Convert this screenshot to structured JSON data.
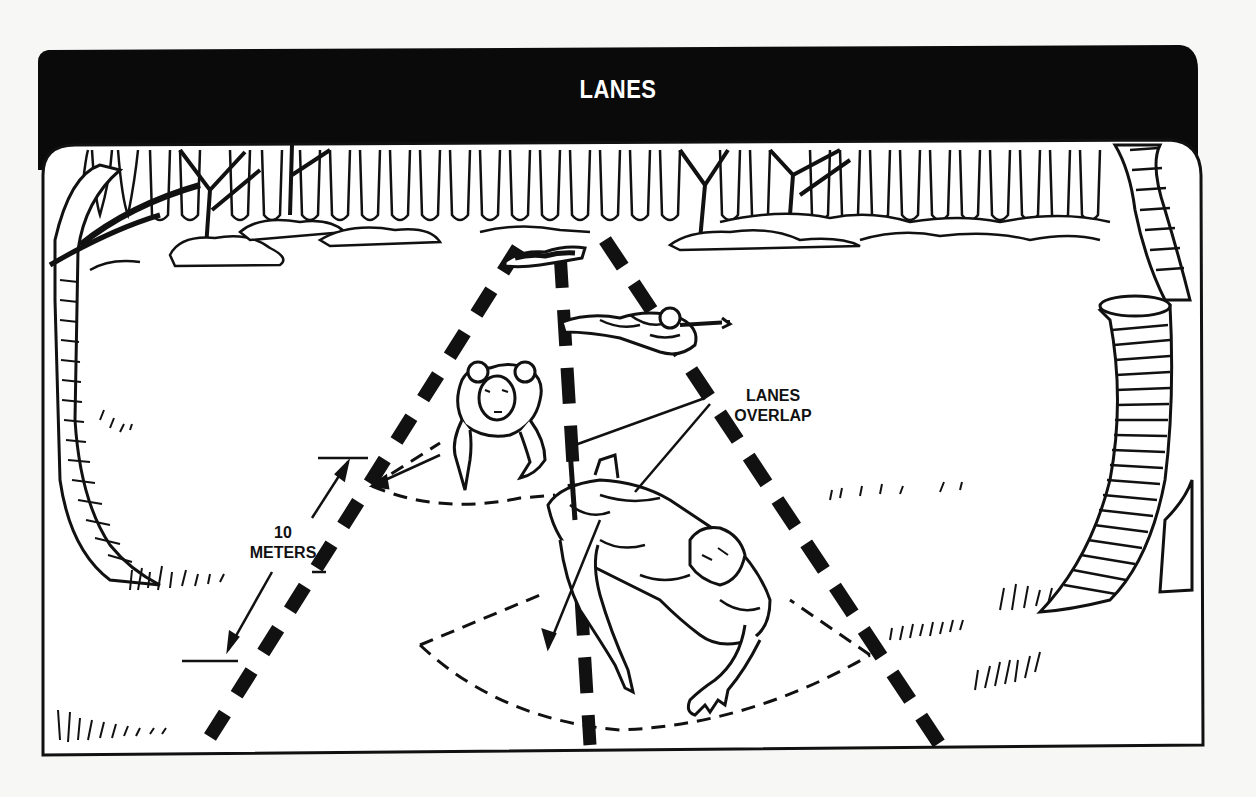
{
  "figure": {
    "title": "LANES",
    "labels": {
      "lanes_overlap_line1": "LANES",
      "lanes_overlap_line2": "OVERLAP",
      "distance_value": "10",
      "distance_unit": "METERS"
    },
    "colors": {
      "ink": "#111111",
      "paper": "#ffffff",
      "background": "#f7f7f5",
      "header_bg": "#0a0a0a",
      "header_text": "#ffffff"
    },
    "scene_elements": [
      "forest-treeline",
      "left-tree",
      "right-tree-stump",
      "three-dashed-lane-lines",
      "distant-prone-soldier",
      "middle-prone-soldier-with-rifle",
      "crawling-soldier-probing",
      "foreground-crawling-soldier-probing",
      "search-arc-sectors",
      "lanes-overlap-pointer-lines",
      "ten-meter-dimension-arrow"
    ]
  }
}
